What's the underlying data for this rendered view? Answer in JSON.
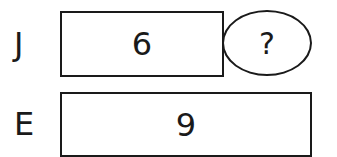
{
  "diagram": {
    "rows": [
      {
        "label": "J",
        "bar_value": "6",
        "extra": "?"
      },
      {
        "label": "E",
        "bar_value": "9"
      }
    ]
  }
}
